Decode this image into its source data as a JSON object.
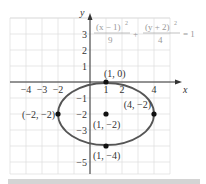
{
  "chart_data": {
    "type": "line",
    "title": "",
    "equation": {
      "lhs_term1_num": "(x − 1)",
      "lhs_term1_den": "9",
      "plus": "+",
      "lhs_term2_num": "(y + 2)",
      "lhs_term2_den": "4",
      "exp": "2",
      "rhs": "= 1"
    },
    "xlabel": "x",
    "ylabel": "y",
    "xlim": [
      -5,
      5
    ],
    "ylim": [
      -6,
      4
    ],
    "grid": true,
    "x_ticks": [
      {
        "value": -4,
        "label": "−4"
      },
      {
        "value": -3,
        "label": "−3"
      },
      {
        "value": -2,
        "label": "−2"
      },
      {
        "value": 1,
        "label": "1"
      },
      {
        "value": 2,
        "label": "2"
      },
      {
        "value": 4,
        "label": "4"
      }
    ],
    "y_ticks": [
      {
        "value": 3,
        "label": "3"
      },
      {
        "value": 2,
        "label": "2"
      },
      {
        "value": 1,
        "label": "1"
      },
      {
        "value": -1,
        "label": "−1"
      },
      {
        "value": -2,
        "label": "−2"
      },
      {
        "value": -3,
        "label": "−3"
      },
      {
        "value": -5,
        "label": "−5"
      }
    ],
    "ellipse": {
      "center": [
        1,
        -2
      ],
      "rx": 3,
      "ry": 2
    },
    "points": [
      {
        "x": 1,
        "y": 0,
        "label": "(1, 0)"
      },
      {
        "x": -2,
        "y": -2,
        "label": "(−2, −2)"
      },
      {
        "x": 1,
        "y": -2,
        "label": "(1, −2)"
      },
      {
        "x": 4,
        "y": -2,
        "label": "(4, −2)"
      },
      {
        "x": 1,
        "y": -4,
        "label": "(1, −4)"
      }
    ]
  },
  "colors": {
    "grid": "#dcdcdc",
    "axis": "#333333",
    "ellipse": "#555555",
    "point": "#111111",
    "text": "#333333",
    "equation": "#999999"
  }
}
